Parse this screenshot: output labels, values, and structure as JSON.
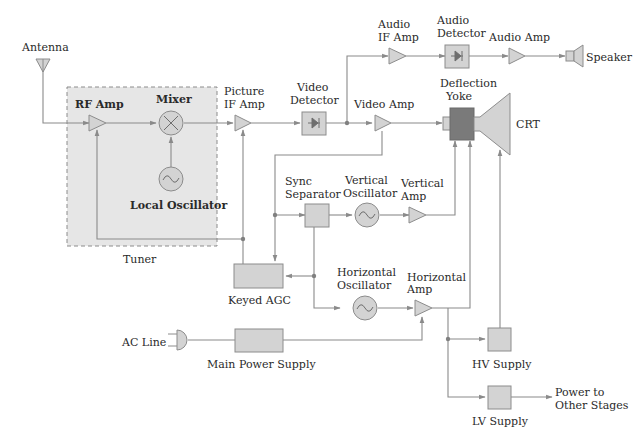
{
  "colors": {
    "block_fill": "#d3d3d3",
    "block_stroke": "#8c8c8c",
    "wire": "#8a8a8a",
    "yoke_fill": "#7a7a7a",
    "tuner_fill": "#e6e6e6",
    "text": "#2a2a2a"
  },
  "labels": {
    "antenna": "Antenna",
    "rf_amp": "RF Amp",
    "mixer": "Mixer",
    "local_oscillator": "Local Oscillator",
    "tuner": "Tuner",
    "picture_if_amp_1": "Picture",
    "picture_if_amp_2": "IF Amp",
    "video_detector_1": "Video",
    "video_detector_2": "Detector",
    "audio_if_amp_1": "Audio",
    "audio_if_amp_2": "IF Amp",
    "audio_detector_1": "Audio",
    "audio_detector_2": "Detector",
    "audio_amp": "Audio Amp",
    "speaker": "Speaker",
    "video_amp": "Video Amp",
    "deflection_yoke_1": "Deflection",
    "deflection_yoke_2": "Yoke",
    "crt": "CRT",
    "sync_separator_1": "Sync",
    "sync_separator_2": "Separator",
    "vertical_oscillator_1": "Vertical",
    "vertical_oscillator_2": "Oscillator",
    "vertical_amp_1": "Vertical",
    "vertical_amp_2": "Amp",
    "keyed_agc": "Keyed AGC",
    "horizontal_oscillator_1": "Horizontal",
    "horizontal_oscillator_2": "Oscillator",
    "horizontal_amp_1": "Horizontal",
    "horizontal_amp_2": "Amp",
    "ac_line": "AC Line",
    "main_power_supply": "Main Power Supply",
    "hv_supply": "HV Supply",
    "lv_supply": "LV Supply",
    "power_to_1": "Power to",
    "power_to_2": "Other Stages"
  },
  "nodes": [
    {
      "id": "antenna",
      "label": "Antenna",
      "shape": "antenna"
    },
    {
      "id": "rf_amp",
      "label": "RF Amp",
      "shape": "amplifier",
      "group": "tuner"
    },
    {
      "id": "mixer",
      "label": "Mixer",
      "shape": "circle-x",
      "group": "tuner"
    },
    {
      "id": "local_oscillator",
      "label": "Local Oscillator",
      "shape": "circle-sine",
      "group": "tuner"
    },
    {
      "id": "picture_if_amp",
      "label": "Picture IF Amp",
      "shape": "amplifier"
    },
    {
      "id": "video_detector",
      "label": "Video Detector",
      "shape": "diode-box"
    },
    {
      "id": "audio_if_amp",
      "label": "Audio IF Amp",
      "shape": "amplifier"
    },
    {
      "id": "audio_detector",
      "label": "Audio Detector",
      "shape": "diode-box"
    },
    {
      "id": "audio_amp",
      "label": "Audio Amp",
      "shape": "amplifier"
    },
    {
      "id": "speaker",
      "label": "Speaker",
      "shape": "speaker"
    },
    {
      "id": "video_amp",
      "label": "Video Amp",
      "shape": "amplifier"
    },
    {
      "id": "deflection_yoke",
      "label": "Deflection Yoke",
      "shape": "box-dark"
    },
    {
      "id": "crt",
      "label": "CRT",
      "shape": "crt"
    },
    {
      "id": "sync_separator",
      "label": "Sync Separator",
      "shape": "box"
    },
    {
      "id": "vertical_oscillator",
      "label": "Vertical Oscillator",
      "shape": "circle-sine"
    },
    {
      "id": "vertical_amp",
      "label": "Vertical Amp",
      "shape": "amplifier"
    },
    {
      "id": "keyed_agc",
      "label": "Keyed AGC",
      "shape": "box"
    },
    {
      "id": "horizontal_oscillator",
      "label": "Horizontal Oscillator",
      "shape": "circle-sine"
    },
    {
      "id": "horizontal_amp",
      "label": "Horizontal Amp",
      "shape": "amplifier"
    },
    {
      "id": "ac_line",
      "label": "AC Line",
      "shape": "plug"
    },
    {
      "id": "main_power_supply",
      "label": "Main Power Supply",
      "shape": "box"
    },
    {
      "id": "hv_supply",
      "label": "HV Supply",
      "shape": "box"
    },
    {
      "id": "lv_supply",
      "label": "LV Supply",
      "shape": "box"
    },
    {
      "id": "power_out",
      "label": "Power to Other Stages",
      "shape": "text"
    }
  ],
  "edges": [
    [
      "antenna",
      "rf_amp"
    ],
    [
      "rf_amp",
      "mixer"
    ],
    [
      "local_oscillator",
      "mixer"
    ],
    [
      "mixer",
      "picture_if_amp"
    ],
    [
      "picture_if_amp",
      "video_detector"
    ],
    [
      "video_detector",
      "audio_if_amp"
    ],
    [
      "audio_if_amp",
      "audio_detector"
    ],
    [
      "audio_detector",
      "audio_amp"
    ],
    [
      "audio_amp",
      "speaker"
    ],
    [
      "video_detector",
      "video_amp"
    ],
    [
      "video_amp",
      "deflection_yoke"
    ],
    [
      "deflection_yoke",
      "crt"
    ],
    [
      "video_amp",
      "sync_separator"
    ],
    [
      "video_amp",
      "keyed_agc"
    ],
    [
      "sync_separator",
      "vertical_oscillator"
    ],
    [
      "vertical_oscillator",
      "vertical_amp"
    ],
    [
      "vertical_amp",
      "deflection_yoke"
    ],
    [
      "sync_separator",
      "keyed_agc"
    ],
    [
      "sync_separator",
      "horizontal_oscillator"
    ],
    [
      "horizontal_oscillator",
      "horizontal_amp"
    ],
    [
      "horizontal_amp",
      "deflection_yoke"
    ],
    [
      "horizontal_amp",
      "hv_supply"
    ],
    [
      "horizontal_amp",
      "lv_supply"
    ],
    [
      "hv_supply",
      "crt"
    ],
    [
      "keyed_agc",
      "rf_amp"
    ],
    [
      "keyed_agc",
      "picture_if_amp"
    ],
    [
      "ac_line",
      "main_power_supply"
    ],
    [
      "main_power_supply",
      "horizontal_amp"
    ],
    [
      "lv_supply",
      "power_out"
    ]
  ]
}
